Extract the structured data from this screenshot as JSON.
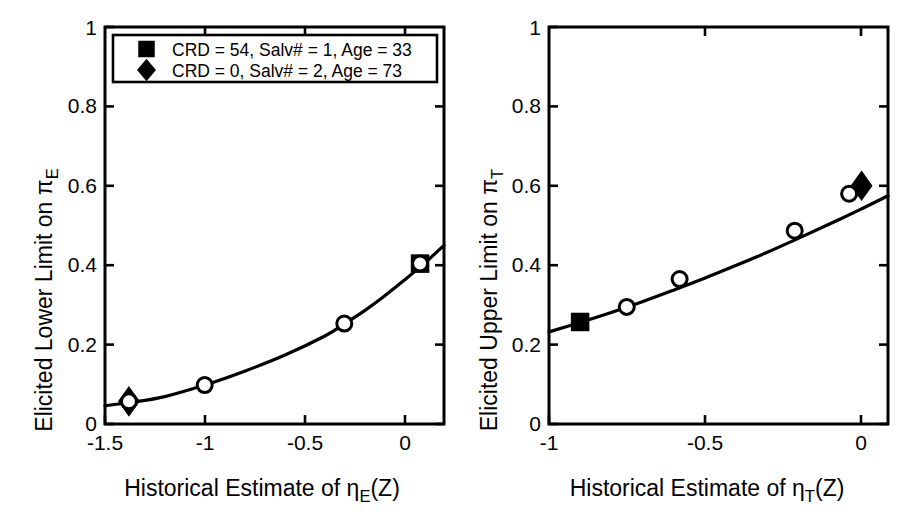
{
  "figure": {
    "background": "#ffffff",
    "ink": "#000000",
    "panel_count": 2
  },
  "chart_data": [
    {
      "type": "line",
      "panel": "left",
      "title": "",
      "xlabel": "Historical Estimate of η_E(Z)",
      "xlabel_parts": {
        "prefix": "Historical Estimate of ",
        "symbol": "η",
        "subscript": "E",
        "suffix": "(Z)"
      },
      "ylabel": "Elicited Lower Limit on π_E",
      "ylabel_parts": {
        "prefix": "Elicited Lower Limit on ",
        "symbol": "π",
        "subscript": "E"
      },
      "xlim": [
        -1.5,
        0.2
      ],
      "ylim": [
        0,
        1
      ],
      "xticks": [
        -1.5,
        -1,
        -0.5,
        0
      ],
      "xticklabels": [
        "-1.5",
        "-1",
        "-0.5",
        "0"
      ],
      "yticks": [
        0,
        0.2,
        0.4,
        0.6,
        0.8,
        1
      ],
      "yticklabels": [
        "0",
        "0.2",
        "0.4",
        "0.6",
        "0.8",
        "1"
      ],
      "grid": false,
      "legend_position": "upper-left-inside",
      "curve": {
        "name": "fitted-curve",
        "x": [
          -1.5,
          -1.35,
          -1.2,
          -1.0,
          -0.8,
          -0.6,
          -0.4,
          -0.3,
          -0.2,
          -0.1,
          0.0,
          0.1,
          0.2
        ],
        "y": [
          0.046,
          0.056,
          0.069,
          0.098,
          0.133,
          0.173,
          0.221,
          0.252,
          0.285,
          0.322,
          0.362,
          0.404,
          0.45
        ]
      },
      "series": [
        {
          "name": "elicited-points-open-circle",
          "marker": "open-circle",
          "points": [
            {
              "x": -1.38,
              "y": 0.057
            },
            {
              "x": -1.0,
              "y": 0.098
            },
            {
              "x": -0.3,
              "y": 0.253
            },
            {
              "x": 0.08,
              "y": 0.404
            }
          ]
        },
        {
          "name": "highlight-diamond",
          "marker": "filled-diamond",
          "label": "CRD = 0, Salv# = 2, Age = 73",
          "points": [
            {
              "x": -1.38,
              "y": 0.057
            }
          ]
        },
        {
          "name": "highlight-square",
          "marker": "filled-square",
          "label": "CRD = 54, Salv# = 1, Age = 33",
          "points": [
            {
              "x": 0.08,
              "y": 0.404
            }
          ]
        }
      ],
      "legend": {
        "entries": [
          {
            "marker": "filled-square",
            "label": "CRD = 54, Salv# = 1, Age = 33"
          },
          {
            "marker": "filled-diamond",
            "label": "CRD = 0, Salv# = 2, Age = 73"
          }
        ]
      }
    },
    {
      "type": "line",
      "panel": "right",
      "title": "",
      "xlabel": "Historical Estimate of η_T(Z)",
      "xlabel_parts": {
        "prefix": "Historical Estimate of ",
        "symbol": "η",
        "subscript": "T",
        "suffix": "(Z)"
      },
      "ylabel": "Elicited Upper Limit on π_T",
      "ylabel_parts": {
        "prefix": "Elicited Upper Limit on ",
        "symbol": "π",
        "subscript": "T"
      },
      "xlim": [
        -1.0,
        0.09
      ],
      "ylim": [
        0,
        1
      ],
      "xticks": [
        -1,
        -0.5,
        0
      ],
      "xticklabels": [
        "-1",
        "-0.5",
        "0"
      ],
      "yticks": [
        0,
        0.2,
        0.4,
        0.6,
        0.8,
        1
      ],
      "yticklabels": [
        "0",
        "0.2",
        "0.4",
        "0.6",
        "0.8",
        "1"
      ],
      "grid": false,
      "legend_position": "none",
      "curve": {
        "name": "fitted-curve",
        "x": [
          -1.0,
          -0.9,
          -0.8,
          -0.7,
          -0.6,
          -0.5,
          -0.4,
          -0.3,
          -0.2,
          -0.1,
          0.0,
          0.09
        ],
        "y": [
          0.232,
          0.256,
          0.281,
          0.308,
          0.337,
          0.367,
          0.399,
          0.432,
          0.467,
          0.503,
          0.54,
          0.575
        ]
      },
      "series": [
        {
          "name": "elicited-points-open-circle",
          "marker": "open-circle",
          "points": [
            {
              "x": -0.75,
              "y": 0.295
            },
            {
              "x": -0.58,
              "y": 0.365
            },
            {
              "x": -0.21,
              "y": 0.487
            },
            {
              "x": -0.035,
              "y": 0.58
            }
          ]
        },
        {
          "name": "highlight-square",
          "marker": "filled-square",
          "label": "CRD = 54, Salv# = 1, Age = 33",
          "points": [
            {
              "x": -0.9,
              "y": 0.257
            }
          ]
        },
        {
          "name": "highlight-diamond",
          "marker": "filled-diamond",
          "label": "CRD = 0, Salv# = 2, Age = 73",
          "points": [
            {
              "x": 0.005,
              "y": 0.6
            }
          ]
        }
      ],
      "legend": {
        "entries": []
      }
    }
  ],
  "left_panel": {
    "ylabel_prefix": "Elicited Lower Limit on ",
    "ylabel_symbol": "π",
    "ylabel_sub": "E",
    "xlabel_prefix": "Historical Estimate of ",
    "xlabel_symbol": "η",
    "xlabel_sub": "E",
    "xlabel_suffix": "(Z)",
    "xtick_0": "-1.5",
    "xtick_1": "-1",
    "xtick_2": "-0.5",
    "xtick_3": "0",
    "ytick_0": "0",
    "ytick_1": "0.2",
    "ytick_2": "0.4",
    "ytick_3": "0.6",
    "ytick_4": "0.8",
    "ytick_5": "1",
    "legend_row_0": "CRD = 54, Salv# = 1, Age = 33",
    "legend_row_1": "CRD = 0, Salv# = 2, Age = 73"
  },
  "right_panel": {
    "ylabel_prefix": "Elicited Upper Limit on ",
    "ylabel_symbol": "π",
    "ylabel_sub": "T",
    "xlabel_prefix": "Historical Estimate of ",
    "xlabel_symbol": "η",
    "xlabel_sub": "T",
    "xlabel_suffix": "(Z)",
    "xtick_0": "-1",
    "xtick_1": "-0.5",
    "xtick_2": "0",
    "ytick_0": "0",
    "ytick_1": "0.2",
    "ytick_2": "0.4",
    "ytick_3": "0.6",
    "ytick_4": "0.8",
    "ytick_5": "1"
  }
}
